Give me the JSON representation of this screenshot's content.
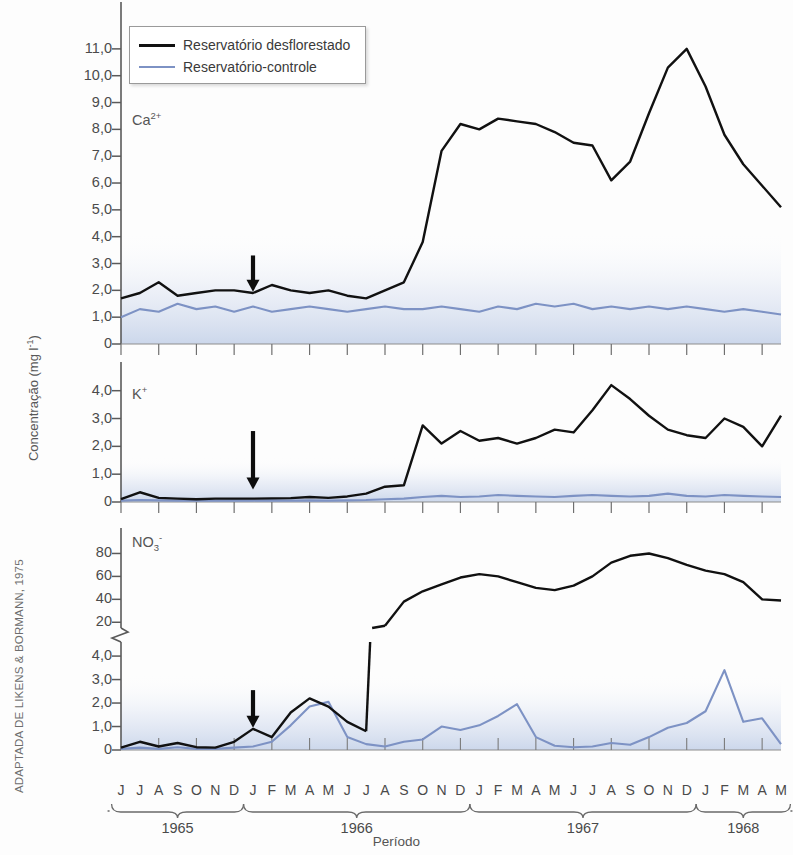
{
  "figure": {
    "source_credit": "ADAPTADA DE LIKENS & BORMANN, 1975",
    "y_axis_title_main": "Concentração (mg l",
    "y_axis_title_sup": "-1",
    "y_axis_title_close": ")",
    "x_axis_title": "Período"
  },
  "legend": {
    "position": "top-left",
    "items": [
      {
        "label": "Reservatório desflorestado",
        "color": "#111111",
        "icon": "line-swatch-black"
      },
      {
        "label": "Reservatório-controle",
        "color": "#7d92c4",
        "icon": "line-swatch-blue"
      }
    ]
  },
  "annotations": {
    "arrow_name": "deforestation-arrow",
    "arrow_month_index": 7,
    "arrow_description": "Seta indicando o momento do desflorestamento"
  },
  "x_axis": {
    "months": [
      "J",
      "J",
      "A",
      "S",
      "O",
      "N",
      "D",
      "J",
      "F",
      "M",
      "A",
      "M",
      "J",
      "J",
      "A",
      "S",
      "O",
      "N",
      "D",
      "J",
      "F",
      "M",
      "A",
      "M",
      "J",
      "J",
      "A",
      "S",
      "O",
      "N",
      "D",
      "J",
      "F",
      "M",
      "A",
      "M"
    ],
    "years": [
      {
        "label": "1965",
        "start_index": 0,
        "end_index": 6
      },
      {
        "label": "1966",
        "start_index": 7,
        "end_index": 18
      },
      {
        "label": "1967",
        "start_index": 19,
        "end_index": 30
      },
      {
        "label": "1968",
        "start_index": 31,
        "end_index": 35
      }
    ]
  },
  "chart_data": [
    {
      "type": "line",
      "title": "Ca2+",
      "species_main": "Ca",
      "species_sup": "2+",
      "ylabel": "Concentração (mg l-1)",
      "xlabel": "Período",
      "ylim": [
        0,
        12.3
      ],
      "yticks": [
        0,
        1.0,
        2.0,
        3.0,
        4.0,
        5.0,
        6.0,
        7.0,
        8.0,
        9.0,
        10.0,
        11.0
      ],
      "ytick_labels": [
        "0",
        "1,0",
        "2,0",
        "3,0",
        "4,0",
        "5,0",
        "6,0",
        "7,0",
        "8,0",
        "9,0",
        "10,0",
        "11,0"
      ],
      "grid": false,
      "x": [
        0,
        1,
        2,
        3,
        4,
        5,
        6,
        7,
        8,
        9,
        10,
        11,
        12,
        13,
        14,
        15,
        16,
        17,
        18,
        19,
        20,
        21,
        22,
        23,
        24,
        25,
        26,
        27,
        28,
        29,
        30,
        31,
        32,
        33,
        34,
        35
      ],
      "series": [
        {
          "name": "Reservatório desflorestado",
          "color": "#111111",
          "values": [
            1.7,
            1.9,
            2.3,
            1.8,
            1.9,
            2.0,
            2.0,
            1.9,
            2.2,
            2.0,
            1.9,
            2.0,
            1.8,
            1.7,
            2.0,
            2.3,
            3.8,
            7.2,
            8.2,
            8.0,
            8.4,
            8.3,
            8.2,
            7.9,
            7.5,
            7.4,
            6.1,
            6.8,
            8.6,
            10.3,
            11.0,
            9.6,
            7.8,
            6.7,
            5.9,
            5.1
          ]
        },
        {
          "name": "Reservatório-controle",
          "color": "#7d92c4",
          "values": [
            1.0,
            1.3,
            1.2,
            1.5,
            1.3,
            1.4,
            1.2,
            1.4,
            1.2,
            1.3,
            1.4,
            1.3,
            1.2,
            1.3,
            1.4,
            1.3,
            1.3,
            1.4,
            1.3,
            1.2,
            1.4,
            1.3,
            1.5,
            1.4,
            1.5,
            1.3,
            1.4,
            1.3,
            1.4,
            1.3,
            1.4,
            1.3,
            1.2,
            1.3,
            1.2,
            1.1
          ]
        }
      ]
    },
    {
      "type": "line",
      "title": "K+",
      "species_main": "K",
      "species_sup": "+",
      "ylim": [
        0,
        4.6
      ],
      "yticks": [
        0,
        1.0,
        2.0,
        3.0,
        4.0
      ],
      "ytick_labels": [
        "0",
        "1,0",
        "2,0",
        "3,0",
        "4,0"
      ],
      "grid": false,
      "x": [
        0,
        1,
        2,
        3,
        4,
        5,
        6,
        7,
        8,
        9,
        10,
        11,
        12,
        13,
        14,
        15,
        16,
        17,
        18,
        19,
        20,
        21,
        22,
        23,
        24,
        25,
        26,
        27,
        28,
        29,
        30,
        31,
        32,
        33,
        34,
        35
      ],
      "series": [
        {
          "name": "Reservatório desflorestado",
          "color": "#111111",
          "values": [
            0.1,
            0.35,
            0.15,
            0.12,
            0.1,
            0.12,
            0.12,
            0.12,
            0.13,
            0.14,
            0.18,
            0.15,
            0.2,
            0.3,
            0.55,
            0.6,
            2.75,
            2.1,
            2.55,
            2.2,
            2.3,
            2.1,
            2.3,
            2.6,
            2.5,
            3.3,
            4.2,
            3.7,
            3.1,
            2.6,
            2.4,
            2.3,
            3.0,
            2.7,
            2.0,
            3.1
          ]
        },
        {
          "name": "Reservatório-controle",
          "color": "#7d92c4",
          "values": [
            0.05,
            0.07,
            0.06,
            0.05,
            0.06,
            0.05,
            0.06,
            0.05,
            0.06,
            0.05,
            0.06,
            0.05,
            0.06,
            0.07,
            0.1,
            0.12,
            0.18,
            0.22,
            0.18,
            0.2,
            0.25,
            0.22,
            0.2,
            0.18,
            0.22,
            0.25,
            0.22,
            0.2,
            0.22,
            0.3,
            0.22,
            0.2,
            0.25,
            0.22,
            0.2,
            0.18
          ]
        }
      ]
    },
    {
      "type": "line",
      "title": "NO3-",
      "species_main": "NO",
      "species_sub": "3",
      "species_sup": "-",
      "broken_axis": true,
      "lower_ylim": [
        0,
        4.6
      ],
      "lower_yticks": [
        0,
        1.0,
        2.0,
        3.0,
        4.0
      ],
      "lower_ytick_labels": [
        "0",
        "1,0",
        "2,0",
        "3,0",
        "4,0"
      ],
      "upper_ylim": [
        15,
        90
      ],
      "upper_yticks": [
        20,
        40,
        60,
        80
      ],
      "upper_ytick_labels": [
        "20",
        "40",
        "60",
        "80"
      ],
      "grid": false,
      "x": [
        0,
        1,
        2,
        3,
        4,
        5,
        6,
        7,
        8,
        9,
        10,
        11,
        12,
        13,
        14,
        15,
        16,
        17,
        18,
        19,
        20,
        21,
        22,
        23,
        24,
        25,
        26,
        27,
        28,
        29,
        30,
        31,
        32,
        33,
        34,
        35
      ],
      "series": [
        {
          "name": "Reservatório desflorestado",
          "color": "#111111",
          "values": [
            0.1,
            0.35,
            0.15,
            0.3,
            0.12,
            0.1,
            0.35,
            0.9,
            0.55,
            1.6,
            2.2,
            1.85,
            1.2,
            0.8,
            17.0,
            38.0,
            47.0,
            53.0,
            59.0,
            62.0,
            60.0,
            55.0,
            50.0,
            48.0,
            52.0,
            60.0,
            72.0,
            78.0,
            80.0,
            76.0,
            70.0,
            65.0,
            62.0,
            55.0,
            40.0,
            39.0
          ]
        },
        {
          "name": "Reservatório-controle",
          "color": "#7d92c4",
          "values": [
            0.05,
            0.1,
            0.05,
            0.12,
            0.05,
            0.05,
            0.1,
            0.15,
            0.35,
            1.05,
            1.85,
            2.05,
            0.55,
            0.25,
            0.15,
            0.35,
            0.45,
            1.0,
            0.85,
            1.05,
            1.45,
            1.95,
            0.55,
            0.18,
            0.12,
            0.15,
            0.3,
            0.22,
            0.55,
            0.95,
            1.15,
            1.65,
            3.4,
            1.2,
            1.35,
            0.25
          ]
        }
      ]
    }
  ]
}
